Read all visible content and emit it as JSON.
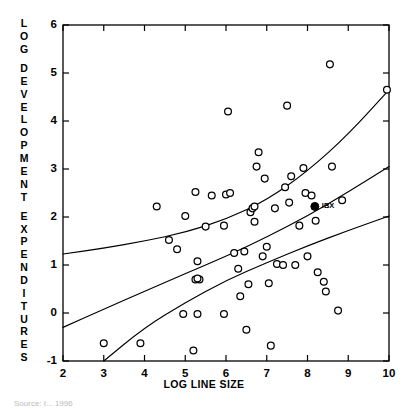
{
  "chart_data": {
    "type": "scatter",
    "title": "",
    "xlabel": "LOG LINE SIZE",
    "ylabel": "LOG DEVELOPMENT EXPENDITURES",
    "xlim": [
      2,
      10
    ],
    "ylim": [
      -1,
      6
    ],
    "xticks": [
      2,
      3,
      4,
      5,
      6,
      7,
      8,
      9,
      10
    ],
    "yticks": [
      -1,
      0,
      1,
      2,
      3,
      4,
      5,
      6
    ],
    "xtick_labels": [
      "2",
      "3",
      "4",
      "5",
      "6",
      "7",
      "8",
      "9",
      "10"
    ],
    "ytick_labels": [
      "-1",
      "0",
      "1",
      "2",
      "3",
      "4",
      "5",
      "6"
    ],
    "grid": false,
    "legend": "none",
    "marker": "open-circle",
    "marker_color": "#000000",
    "highlight_marker": "filled-circle",
    "series": [
      {
        "name": "firms",
        "marker": "open-circle",
        "points": [
          [
            3.0,
            -0.63
          ],
          [
            3.9,
            -0.63
          ],
          [
            5.2,
            -0.78
          ],
          [
            4.6,
            1.52
          ],
          [
            4.8,
            1.33
          ],
          [
            5.3,
            1.08
          ],
          [
            5.25,
            0.7
          ],
          [
            5.35,
            0.7
          ],
          [
            5.25,
            2.52
          ],
          [
            4.95,
            -0.02
          ],
          [
            5.3,
            -0.02
          ],
          [
            5.95,
            -0.02
          ],
          [
            5.3,
            0.72
          ],
          [
            5.5,
            1.8
          ],
          [
            5.95,
            1.82
          ],
          [
            5.65,
            2.45
          ],
          [
            6.0,
            2.47
          ],
          [
            6.05,
            4.2
          ],
          [
            6.1,
            2.5
          ],
          [
            6.2,
            1.25
          ],
          [
            6.3,
            0.92
          ],
          [
            6.35,
            0.35
          ],
          [
            6.5,
            -0.35
          ],
          [
            6.55,
            0.6
          ],
          [
            6.6,
            2.1
          ],
          [
            6.65,
            2.18
          ],
          [
            6.7,
            2.22
          ],
          [
            6.7,
            1.9
          ],
          [
            6.75,
            3.05
          ],
          [
            6.8,
            3.35
          ],
          [
            6.95,
            2.8
          ],
          [
            7.0,
            1.38
          ],
          [
            7.05,
            0.62
          ],
          [
            7.1,
            -0.68
          ],
          [
            7.2,
            2.18
          ],
          [
            7.25,
            1.02
          ],
          [
            7.4,
            1.0
          ],
          [
            7.45,
            2.62
          ],
          [
            7.5,
            4.32
          ],
          [
            7.55,
            2.3
          ],
          [
            7.6,
            2.85
          ],
          [
            7.7,
            1.0
          ],
          [
            7.8,
            1.82
          ],
          [
            7.95,
            2.5
          ],
          [
            8.0,
            1.18
          ],
          [
            8.1,
            2.45
          ],
          [
            8.2,
            1.92
          ],
          [
            8.25,
            0.85
          ],
          [
            8.4,
            0.65
          ],
          [
            8.45,
            0.45
          ],
          [
            8.55,
            5.18
          ],
          [
            8.6,
            3.05
          ],
          [
            8.75,
            0.05
          ],
          [
            8.85,
            2.35
          ],
          [
            9.95,
            4.65
          ],
          [
            5.0,
            2.02
          ],
          [
            4.3,
            2.22
          ],
          [
            6.45,
            1.28
          ],
          [
            7.9,
            3.02
          ],
          [
            6.9,
            1.18
          ]
        ]
      },
      {
        "name": "IBX",
        "marker": "filled-circle",
        "label": "IBX",
        "points": [
          [
            8.18,
            2.22
          ]
        ]
      }
    ],
    "curves": [
      {
        "name": "upper-confidence-band",
        "points": [
          [
            2.0,
            1.23
          ],
          [
            3.0,
            1.35
          ],
          [
            4.0,
            1.5
          ],
          [
            5.0,
            1.68
          ],
          [
            6.0,
            1.95
          ],
          [
            7.0,
            2.35
          ],
          [
            8.0,
            2.95
          ],
          [
            9.0,
            3.72
          ],
          [
            10.0,
            4.65
          ]
        ]
      },
      {
        "name": "regression-line",
        "points": [
          [
            2.0,
            -0.3
          ],
          [
            3.0,
            0.08
          ],
          [
            4.0,
            0.45
          ],
          [
            5.0,
            0.82
          ],
          [
            6.0,
            1.18
          ],
          [
            7.0,
            1.58
          ],
          [
            8.0,
            2.02
          ],
          [
            9.0,
            2.52
          ],
          [
            10.0,
            3.05
          ]
        ]
      },
      {
        "name": "lower-confidence-band",
        "points": [
          [
            3.0,
            -1.0
          ],
          [
            4.0,
            -0.3
          ],
          [
            5.0,
            0.22
          ],
          [
            6.0,
            0.68
          ],
          [
            7.0,
            1.05
          ],
          [
            8.0,
            1.4
          ],
          [
            9.0,
            1.72
          ],
          [
            10.0,
            2.02
          ]
        ]
      }
    ]
  },
  "source_note": "Source: I...  1996"
}
